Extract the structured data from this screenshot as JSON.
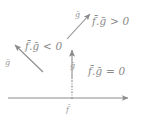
{
  "figure": {
    "background_color": "#ffffff",
    "stroke_color": "#8c8c8c",
    "text_color": "#8a8a8a",
    "width": 145,
    "height": 124
  },
  "labels": {
    "positive_region": "f̄.ḡ > 0",
    "negative_region": "f̄.ḡ < 0",
    "zero_region": "f̄.ḡ = 0",
    "g_upper_right": "ḡ",
    "g_upper_left": "ḡ",
    "g_vertical": "ḡ",
    "f_origin": "f̄"
  },
  "geometry": {
    "horizontal_axis": {
      "x1": 8,
      "y1": 98,
      "x2": 134,
      "y2": 98,
      "arrow": "right-end"
    },
    "vertical_vector": {
      "x1": 72,
      "y1": 78,
      "x2": 72,
      "y2": 46,
      "arrow": "top-end",
      "style": "solid"
    },
    "vertical_dashdot": {
      "x1": 72,
      "y1": 98,
      "x2": 72,
      "y2": 78,
      "style": "dash-dot"
    },
    "arrow_upper_right": {
      "x1": 67,
      "y1": 39,
      "x2": 93,
      "y2": 11
    },
    "arrow_upper_left": {
      "x1": 43,
      "y1": 72,
      "x2": 12,
      "y2": 42
    }
  }
}
